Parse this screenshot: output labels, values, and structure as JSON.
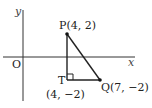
{
  "diagram": {
    "type": "coordinate-geometry",
    "axes": {
      "x_label": "x",
      "y_label": "y",
      "origin_label": "O"
    },
    "points": {
      "P": {
        "label": "P(4, 2)",
        "x": 4,
        "y": 2
      },
      "Q": {
        "label": "Q(7, −2)",
        "x": 7,
        "y": -2
      },
      "T": {
        "label": "T",
        "coord_label": "(4, −2)",
        "x": 4,
        "y": -2
      }
    },
    "segments": [
      "PT",
      "TQ",
      "PQ"
    ],
    "right_angle_at": "T",
    "colors": {
      "line": "#222222",
      "axis": "#333333",
      "background": "#ffffff"
    }
  }
}
